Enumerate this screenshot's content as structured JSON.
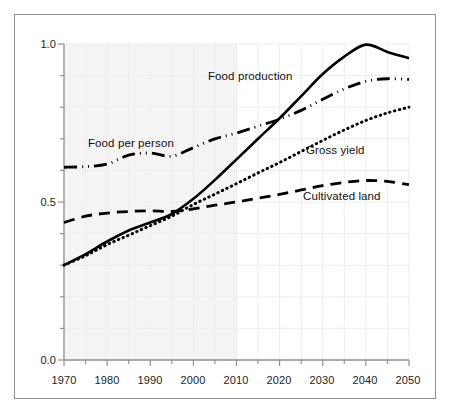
{
  "chart_data": {
    "type": "line",
    "title": "",
    "subtitle": "",
    "xlabel": "",
    "ylabel": "",
    "xlim": [
      1970,
      2050
    ],
    "ylim": [
      0.0,
      1.0
    ],
    "grid": true,
    "legend_position": "inline-annotations",
    "x_ticks_major": [
      1970,
      1980,
      1990,
      2000,
      2010,
      2020,
      2030,
      2040,
      2050
    ],
    "x_tick_labels": [
      "1970",
      "1980",
      "1990",
      "2000",
      "2010",
      "2020",
      "2030",
      "2040",
      "2050"
    ],
    "x_ticks_minor": [
      1975,
      1985,
      1995,
      2005,
      2015,
      2025,
      2035,
      2045
    ],
    "y_ticks_major": [
      0.0,
      0.5,
      1.0
    ],
    "y_tick_labels": [
      "0.0",
      "0.5",
      "1.0"
    ],
    "y_ticks_minor": [
      0.1,
      0.2,
      0.3,
      0.4,
      0.6,
      0.7,
      0.8,
      0.9
    ],
    "shaded_region": {
      "from": 1970,
      "to": 2010,
      "color": "#f4f4f4",
      "note": "historical period shading"
    },
    "x": [
      1970,
      1975,
      1980,
      1985,
      1990,
      1995,
      2000,
      2005,
      2010,
      2015,
      2020,
      2025,
      2030,
      2035,
      2040,
      2045,
      2050
    ],
    "series": [
      {
        "name": "Food production",
        "style": "solid",
        "color": "#000000",
        "values": [
          0.3,
          0.335,
          0.375,
          0.41,
          0.435,
          0.462,
          0.51,
          0.57,
          0.635,
          0.7,
          0.765,
          0.835,
          0.905,
          0.96,
          0.998,
          0.975,
          0.955
        ]
      },
      {
        "name": "Food per person",
        "style": "dash-dot-dot",
        "color": "#000000",
        "values": [
          0.61,
          0.612,
          0.62,
          0.648,
          0.655,
          0.645,
          0.672,
          0.7,
          0.718,
          0.74,
          0.762,
          0.79,
          0.825,
          0.858,
          0.882,
          0.89,
          0.888
        ]
      },
      {
        "name": "Gross yield",
        "style": "dotted",
        "color": "#000000",
        "values": [
          0.3,
          0.33,
          0.365,
          0.395,
          0.425,
          0.455,
          0.492,
          0.525,
          0.558,
          0.592,
          0.625,
          0.66,
          0.695,
          0.728,
          0.758,
          0.782,
          0.8
        ]
      },
      {
        "name": "Cultivated land",
        "style": "dashed",
        "color": "#000000",
        "values": [
          0.435,
          0.455,
          0.465,
          0.47,
          0.472,
          0.47,
          0.478,
          0.49,
          0.5,
          0.512,
          0.524,
          0.538,
          0.552,
          0.562,
          0.568,
          0.565,
          0.555
        ]
      }
    ],
    "annotations": [
      {
        "text": "Food production",
        "x": 2006,
        "y": 0.905
      },
      {
        "text": "Food per person",
        "x": 1984,
        "y": 0.7
      },
      {
        "text": "Gross yield",
        "x": 2028,
        "y": 0.69
      },
      {
        "text": "Cultivated land",
        "x": 2030,
        "y": 0.585
      }
    ]
  },
  "axes": {
    "y_labels": [
      "1.0",
      "0.5",
      "0.0"
    ],
    "x_labels": [
      "1970",
      "1980",
      "1990",
      "2000",
      "2010",
      "2020",
      "2030",
      "2040",
      "2050"
    ]
  },
  "labels": {
    "food_production": "Food production",
    "food_per_person": "Food per person",
    "gross_yield": "Gross yield",
    "cultivated_land": "Cultivated land"
  },
  "colors": {
    "line": "#000000",
    "axis": "#8e9296",
    "grid": "#ededed",
    "shading": "#f4f4f4",
    "frame": "#8e9296",
    "text": "#1c1c1c",
    "background": "#ffffff"
  }
}
